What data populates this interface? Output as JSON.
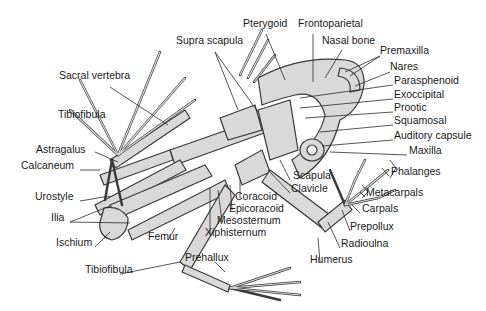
{
  "diagram": {
    "colors": {
      "bone_fill": "#d9d9d9",
      "bone_stroke": "#3a3a3a",
      "leader": "#2a2a2a",
      "text": "#1a1a1a",
      "background": "#ffffff"
    },
    "labels": [
      {
        "id": "pterygoid",
        "text": "Pterygoid",
        "x": 243,
        "y": 23
      },
      {
        "id": "frontoparietal",
        "text": "Frontoparietal",
        "x": 298,
        "y": 23
      },
      {
        "id": "supra-scapula",
        "text": "Supra scapula",
        "x": 176,
        "y": 40
      },
      {
        "id": "nasal-bone",
        "text": "Nasal bone",
        "x": 322,
        "y": 40
      },
      {
        "id": "premaxilla",
        "text": "Premaxilla",
        "x": 380,
        "y": 50
      },
      {
        "id": "nares",
        "text": "Nares",
        "x": 390,
        "y": 66
      },
      {
        "id": "sacral-vertebra",
        "text": "Sacral vertebra",
        "x": 59,
        "y": 75
      },
      {
        "id": "parasphenoid",
        "text": "Parasphenoid",
        "x": 394,
        "y": 80
      },
      {
        "id": "exoccipital",
        "text": "Exoccipital",
        "x": 394,
        "y": 94
      },
      {
        "id": "prootic",
        "text": "Prootic",
        "x": 394,
        "y": 107
      },
      {
        "id": "tibiofibula-upper",
        "text": "Tibiofibula",
        "x": 58,
        "y": 114
      },
      {
        "id": "squamosal",
        "text": "Squamosal",
        "x": 394,
        "y": 120
      },
      {
        "id": "auditory-capsule",
        "text": "Auditory capsule",
        "x": 394,
        "y": 135
      },
      {
        "id": "maxilla",
        "text": "Maxilla",
        "x": 409,
        "y": 150
      },
      {
        "id": "astragalus",
        "text": "Astragalus",
        "x": 36,
        "y": 149
      },
      {
        "id": "calcaneum",
        "text": "Calcaneum",
        "x": 21,
        "y": 165
      },
      {
        "id": "phalanges",
        "text": "Phalanges",
        "x": 391,
        "y": 171
      },
      {
        "id": "scapula",
        "text": "Scapula",
        "x": 293,
        "y": 175
      },
      {
        "id": "clavicle",
        "text": "Clavicle",
        "x": 291,
        "y": 188
      },
      {
        "id": "urostyle",
        "text": "Urostyle",
        "x": 35,
        "y": 196
      },
      {
        "id": "metacarpals",
        "text": "Metacarpals",
        "x": 366,
        "y": 192
      },
      {
        "id": "coracoid",
        "text": "Coracoid",
        "x": 235,
        "y": 194
      },
      {
        "id": "epicoracoid",
        "text": "Epicoracoid",
        "x": 229,
        "y": 206
      },
      {
        "id": "carpals",
        "text": "Carpals",
        "x": 362,
        "y": 208
      },
      {
        "id": "ilia",
        "text": "Ilia",
        "x": 51,
        "y": 217
      },
      {
        "id": "mesosternum",
        "text": "Mesosternum",
        "x": 217,
        "y": 218
      },
      {
        "id": "prepollux",
        "text": "Prepollux",
        "x": 350,
        "y": 226
      },
      {
        "id": "femur",
        "text": "Femur",
        "x": 148,
        "y": 236
      },
      {
        "id": "xiphisternum",
        "text": "Xiphisternum",
        "x": 205,
        "y": 231
      },
      {
        "id": "ischium",
        "text": "Ischium",
        "x": 56,
        "y": 242
      },
      {
        "id": "radioulna",
        "text": "Radioulna",
        "x": 341,
        "y": 243
      },
      {
        "id": "humerus",
        "text": "Humerus",
        "x": 310,
        "y": 259
      },
      {
        "id": "prehallux",
        "text": "Prehallux",
        "x": 185,
        "y": 257
      },
      {
        "id": "tibiofibula-lower",
        "text": "Tibiofibula",
        "x": 85,
        "y": 269
      }
    ]
  }
}
